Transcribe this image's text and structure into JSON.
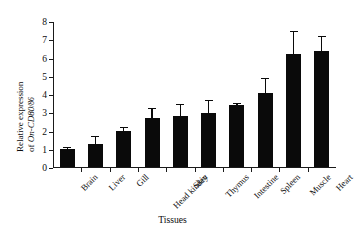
{
  "chart_data": {
    "type": "bar",
    "title": "",
    "xlabel": "Tissues",
    "ylabel_line1": "Relative expression",
    "ylabel_line2_prefix": "of ",
    "ylabel_gene": "On-CD80",
    "ylabel_gene_sub": "/86",
    "ylabel": "Relative expression of On-CD80/86",
    "categories": [
      "Brain",
      "Liver",
      "Gill",
      "Head kindey",
      "Skin",
      "Thymus",
      "Intestine",
      "Spleen",
      "Muscle",
      "Heart"
    ],
    "values": [
      1.0,
      1.27,
      1.95,
      2.67,
      2.78,
      2.97,
      3.38,
      4.08,
      6.2,
      6.35
    ],
    "errors": [
      0.17,
      0.48,
      0.28,
      0.63,
      0.73,
      0.78,
      0.2,
      0.87,
      1.3,
      0.9
    ],
    "ylim": [
      0,
      8
    ],
    "yticks": [
      0,
      1,
      2,
      3,
      4,
      5,
      6,
      7,
      8
    ],
    "ytick_labels": [
      "0",
      "1",
      "2",
      "3",
      "4",
      "5",
      "6",
      "7",
      "8"
    ],
    "grid": false,
    "legend": false,
    "bar_color": "#0a0a0a",
    "axis_color": "#1a1a1a",
    "background": "#ffffff"
  }
}
